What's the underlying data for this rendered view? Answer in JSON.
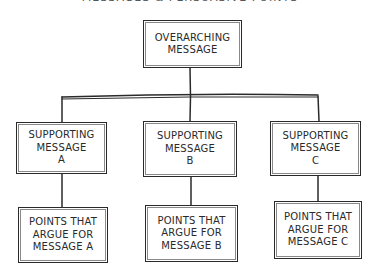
{
  "diagram": {
    "title": "MESSAGES & PERSUASIVE POINTS",
    "root": {
      "label": "OVERARCHING\nMESSAGE"
    },
    "supporting": [
      {
        "label": "SUPPORTING\nMESSAGE\nA"
      },
      {
        "label": "SUPPORTING\nMESSAGE\nB"
      },
      {
        "label": "SUPPORTING\nMESSAGE\nC"
      }
    ],
    "points": [
      {
        "label": "POINTS THAT\nARGUE FOR\nMESSAGE A"
      },
      {
        "label": "POINTS THAT\nARGUE FOR\nMESSAGE B"
      },
      {
        "label": "POINTS THAT\nARGUE FOR\nMESSAGE C"
      }
    ],
    "colors": {
      "ink": "#2a2a2a",
      "background": "#ffffff"
    }
  }
}
